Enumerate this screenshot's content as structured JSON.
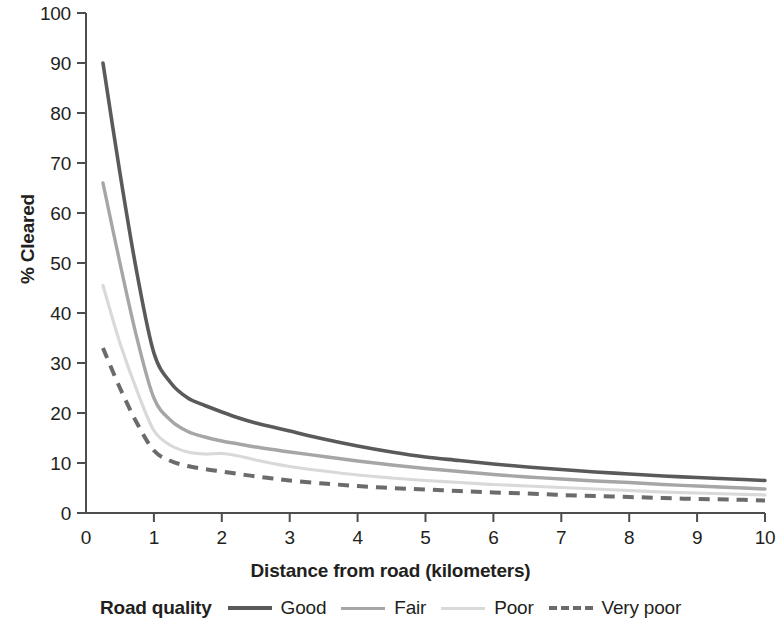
{
  "chart_data": {
    "type": "line",
    "title": "",
    "xlabel": "Distance from road (kilometers)",
    "ylabel": "% Cleared",
    "xlim": [
      0,
      10
    ],
    "ylim": [
      0,
      100
    ],
    "xticks": [
      "0",
      "1",
      "2",
      "3",
      "4",
      "5",
      "6",
      "7",
      "8",
      "9",
      "10"
    ],
    "yticks": [
      "0",
      "10",
      "20",
      "30",
      "40",
      "50",
      "60",
      "70",
      "80",
      "90",
      "100"
    ],
    "grid": false,
    "legend_position": "bottom",
    "legend_title": "Road quality",
    "x": [
      0.25,
      0.5,
      0.75,
      1.0,
      1.25,
      1.5,
      1.75,
      2.0,
      2.25,
      2.5,
      2.75,
      3.0,
      3.5,
      4.0,
      4.5,
      5.0,
      5.5,
      6.0,
      6.5,
      7.0,
      7.5,
      8.0,
      8.5,
      9.0,
      9.5,
      10.0
    ],
    "series": [
      {
        "name": "Good",
        "color": "#5a5a5a",
        "style": "solid",
        "width": 3.6,
        "values": [
          90.0,
          68.0,
          48.0,
          32.0,
          26.0,
          23.0,
          21.5,
          20.2,
          19.0,
          18.0,
          17.2,
          16.4,
          14.8,
          13.4,
          12.2,
          11.2,
          10.5,
          9.8,
          9.2,
          8.7,
          8.2,
          7.8,
          7.4,
          7.1,
          6.8,
          6.5
        ]
      },
      {
        "name": "Fair",
        "color": "#a6a6a6",
        "style": "solid",
        "width": 3.4,
        "values": [
          66.0,
          50.0,
          35.0,
          23.0,
          18.5,
          16.3,
          15.2,
          14.4,
          13.8,
          13.2,
          12.7,
          12.2,
          11.3,
          10.4,
          9.6,
          8.9,
          8.3,
          7.7,
          7.2,
          6.8,
          6.4,
          6.1,
          5.7,
          5.4,
          5.1,
          4.8
        ]
      },
      {
        "name": "Poor",
        "color": "#d9d9d9",
        "style": "solid",
        "width": 3.2,
        "values": [
          45.5,
          34.0,
          24.5,
          16.5,
          13.5,
          12.2,
          11.8,
          11.9,
          11.4,
          10.6,
          9.9,
          9.3,
          8.4,
          7.6,
          7.0,
          6.5,
          6.1,
          5.7,
          5.4,
          5.1,
          4.8,
          4.5,
          4.2,
          4.0,
          3.8,
          3.6
        ]
      },
      {
        "name": "Very poor",
        "color": "#6b6b6b",
        "style": "dashed",
        "width": 4.0,
        "values": [
          33.0,
          25.0,
          18.0,
          12.5,
          10.4,
          9.4,
          8.8,
          8.3,
          7.8,
          7.3,
          6.9,
          6.5,
          5.9,
          5.4,
          5.0,
          4.7,
          4.4,
          4.1,
          3.9,
          3.6,
          3.4,
          3.2,
          3.0,
          2.8,
          2.7,
          2.5
        ]
      }
    ]
  },
  "axis": {
    "y_label": "% Cleared",
    "x_label": "Distance from road (kilometers)"
  },
  "legend": {
    "title": "Road quality",
    "items": [
      {
        "label": "Good"
      },
      {
        "label": "Fair"
      },
      {
        "label": "Poor"
      },
      {
        "label": "Very poor"
      }
    ]
  }
}
